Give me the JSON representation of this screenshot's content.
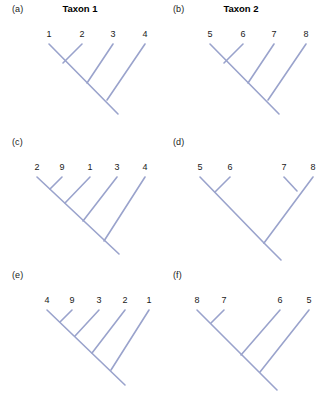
{
  "figure": {
    "type": "phylogenetic-tree-figure",
    "background_color": "#ffffff",
    "branch_color": "#9aa3cc",
    "label_color": "#1a1a1a",
    "panel_count": 6
  },
  "headers": {
    "taxon1": "Taxon 1",
    "taxon2": "Taxon 2"
  },
  "panels": [
    {
      "id": "a",
      "label": "(a)",
      "title": "Taxon 1",
      "has_title": true,
      "topology": "pectinate",
      "tip_count": 4,
      "tips": [
        "1",
        "2",
        "3",
        "4"
      ]
    },
    {
      "id": "b",
      "label": "(b)",
      "title": "Taxon 2",
      "has_title": true,
      "topology": "pectinate",
      "tip_count": 4,
      "tips": [
        "5",
        "6",
        "7",
        "8"
      ]
    },
    {
      "id": "c",
      "label": "(c)",
      "title": "",
      "has_title": false,
      "topology": "pectinate",
      "tip_count": 5,
      "tips": [
        "2",
        "9",
        "1",
        "3",
        "4"
      ]
    },
    {
      "id": "d",
      "label": "(d)",
      "title": "",
      "has_title": false,
      "topology": "balanced",
      "tip_count": 4,
      "tips": [
        "5",
        "6",
        "7",
        "8"
      ]
    },
    {
      "id": "e",
      "label": "(e)",
      "title": "",
      "has_title": false,
      "topology": "pectinate",
      "tip_count": 5,
      "tips": [
        "4",
        "9",
        "3",
        "2",
        "1"
      ]
    },
    {
      "id": "f",
      "label": "(f)",
      "title": "",
      "has_title": false,
      "topology": "pectinate-offset",
      "tip_count": 4,
      "tips": [
        "8",
        "7",
        "6",
        "5"
      ]
    }
  ]
}
